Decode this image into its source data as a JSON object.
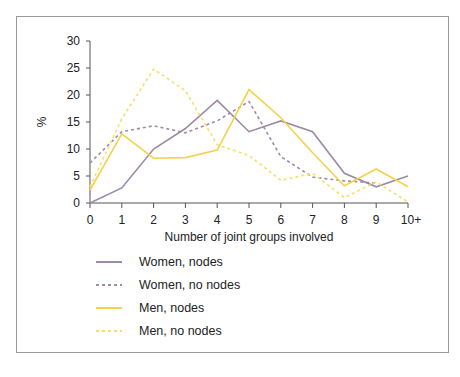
{
  "chart_data": {
    "type": "line",
    "title": "",
    "xlabel": "Number of joint groups involved",
    "ylabel": "%",
    "ylim": [
      0,
      30
    ],
    "yticks": [
      0,
      5,
      10,
      15,
      20,
      25,
      30
    ],
    "grid": false,
    "legend_position": "bottom-left",
    "categories": [
      "0",
      "1",
      "2",
      "3",
      "4",
      "5",
      "6",
      "7",
      "8",
      "9",
      "10+"
    ],
    "series": [
      {
        "name": "Women, nodes",
        "style": "solid",
        "color": "#9d8aa6",
        "values": [
          0,
          2.8,
          10,
          13.8,
          19,
          13.2,
          15.2,
          13.2,
          5.5,
          3,
          5
        ]
      },
      {
        "name": "Women, no nodes",
        "style": "dashed",
        "color": "#9d8aa6",
        "values": [
          7.4,
          13.2,
          14.3,
          13,
          15.2,
          18.8,
          8.6,
          4.8,
          4.1,
          3.7,
          null
        ]
      },
      {
        "name": "Men, nodes",
        "style": "solid",
        "color": "#f2d34a",
        "values": [
          2.4,
          12.8,
          8.3,
          8.4,
          9.8,
          21,
          15.8,
          9.3,
          3.2,
          6.3,
          3
        ]
      },
      {
        "name": "Men, no nodes",
        "style": "dashed",
        "color": "#f7de6a",
        "values": [
          3,
          15.6,
          24.8,
          20.8,
          10.8,
          8.8,
          4.2,
          5.5,
          1,
          3.9,
          0.2
        ]
      }
    ]
  },
  "legend": {
    "items": [
      {
        "label": "Women, nodes"
      },
      {
        "label": "Women, no nodes"
      },
      {
        "label": "Men, nodes"
      },
      {
        "label": "Men, no nodes"
      }
    ]
  }
}
